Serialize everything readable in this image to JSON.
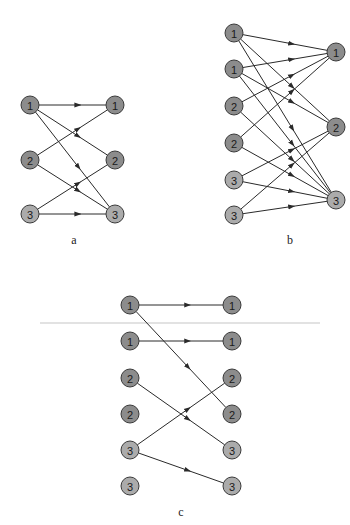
{
  "colors": {
    "node_dark": "#8c8c8c",
    "node_light": "#ababab",
    "edge": "#2a2a2a",
    "background": "#ffffff"
  },
  "node_radius": 9,
  "panels": [
    {
      "id": "a",
      "label": "a",
      "label_pos": [
        74,
        244
      ],
      "nodes": [
        {
          "id": "L1",
          "label": "1",
          "x": 30,
          "y": 105,
          "shade": "dark"
        },
        {
          "id": "L2",
          "label": "2",
          "x": 30,
          "y": 160,
          "shade": "dark"
        },
        {
          "id": "L3",
          "label": "3",
          "x": 30,
          "y": 214,
          "shade": "light"
        },
        {
          "id": "R1",
          "label": "1",
          "x": 115,
          "y": 105,
          "shade": "dark"
        },
        {
          "id": "R2",
          "label": "2",
          "x": 115,
          "y": 160,
          "shade": "dark"
        },
        {
          "id": "R3",
          "label": "3",
          "x": 115,
          "y": 214,
          "shade": "light"
        }
      ],
      "edges": [
        [
          "L1",
          "R1"
        ],
        [
          "L1",
          "R2"
        ],
        [
          "L1",
          "R3"
        ],
        [
          "L2",
          "R1"
        ],
        [
          "L2",
          "R3"
        ],
        [
          "L3",
          "R2"
        ],
        [
          "L3",
          "R3"
        ]
      ]
    },
    {
      "id": "b",
      "label": "b",
      "label_pos": [
        290,
        244
      ],
      "nodes": [
        {
          "id": "L1a",
          "label": "1",
          "x": 234,
          "y": 33,
          "shade": "dark"
        },
        {
          "id": "L1b",
          "label": "1",
          "x": 234,
          "y": 69,
          "shade": "dark"
        },
        {
          "id": "L2a",
          "label": "2",
          "x": 234,
          "y": 106,
          "shade": "dark"
        },
        {
          "id": "L2b",
          "label": "2",
          "x": 234,
          "y": 143,
          "shade": "dark"
        },
        {
          "id": "L3a",
          "label": "3",
          "x": 234,
          "y": 180,
          "shade": "light"
        },
        {
          "id": "L3b",
          "label": "3",
          "x": 234,
          "y": 215,
          "shade": "light"
        },
        {
          "id": "R1",
          "label": "1",
          "x": 336,
          "y": 52,
          "shade": "dark"
        },
        {
          "id": "R2",
          "label": "2",
          "x": 336,
          "y": 127,
          "shade": "dark"
        },
        {
          "id": "R3",
          "label": "3",
          "x": 336,
          "y": 200,
          "shade": "light"
        }
      ],
      "edges": [
        [
          "L1a",
          "R1"
        ],
        [
          "L1a",
          "R2"
        ],
        [
          "L1a",
          "R3"
        ],
        [
          "L1b",
          "R1"
        ],
        [
          "L1b",
          "R2"
        ],
        [
          "L1b",
          "R3"
        ],
        [
          "L2a",
          "R1"
        ],
        [
          "L2a",
          "R3"
        ],
        [
          "L2b",
          "R1"
        ],
        [
          "L2b",
          "R3"
        ],
        [
          "L3a",
          "R2"
        ],
        [
          "L3a",
          "R3"
        ],
        [
          "L3b",
          "R2"
        ],
        [
          "L3b",
          "R3"
        ]
      ]
    },
    {
      "id": "c",
      "label": "c",
      "label_pos": [
        181,
        516
      ],
      "nodes": [
        {
          "id": "L1a",
          "label": "1",
          "x": 130,
          "y": 305,
          "shade": "dark"
        },
        {
          "id": "L1b",
          "label": "1",
          "x": 130,
          "y": 341,
          "shade": "dark"
        },
        {
          "id": "L2a",
          "label": "2",
          "x": 130,
          "y": 378,
          "shade": "dark"
        },
        {
          "id": "L2b",
          "label": "2",
          "x": 130,
          "y": 414,
          "shade": "dark"
        },
        {
          "id": "L3a",
          "label": "3",
          "x": 130,
          "y": 450,
          "shade": "light"
        },
        {
          "id": "L3b",
          "label": "3",
          "x": 130,
          "y": 486,
          "shade": "light"
        },
        {
          "id": "R1a",
          "label": "1",
          "x": 232,
          "y": 305,
          "shade": "dark"
        },
        {
          "id": "R1b",
          "label": "1",
          "x": 232,
          "y": 341,
          "shade": "dark"
        },
        {
          "id": "R2a",
          "label": "2",
          "x": 232,
          "y": 378,
          "shade": "dark"
        },
        {
          "id": "R2b",
          "label": "2",
          "x": 232,
          "y": 414,
          "shade": "dark"
        },
        {
          "id": "R3a",
          "label": "3",
          "x": 232,
          "y": 450,
          "shade": "light"
        },
        {
          "id": "R3b",
          "label": "3",
          "x": 232,
          "y": 486,
          "shade": "light"
        }
      ],
      "edges": [
        [
          "L1a",
          "R1a"
        ],
        [
          "L1a",
          "R2b"
        ],
        [
          "L1b",
          "R1b"
        ],
        [
          "L2a",
          "R3a"
        ],
        [
          "L3a",
          "R2a"
        ],
        [
          "L3a",
          "R3b"
        ]
      ]
    }
  ]
}
